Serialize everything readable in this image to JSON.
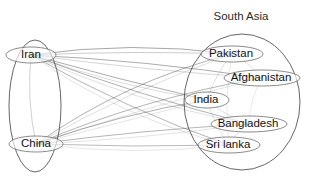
{
  "figure": {
    "kind": "network-graph",
    "background_color": "#ffffff",
    "width": 310,
    "height": 180
  },
  "clusters": [
    {
      "id": "left-cluster",
      "label": "",
      "label_visible": false,
      "shape": "ellipse",
      "cx": 35,
      "cy": 106,
      "rx": 26,
      "ry": 66,
      "stroke": "#4a4a4a"
    },
    {
      "id": "south-asia-cluster",
      "label": "South Asia",
      "label_visible": true,
      "label_x": 241,
      "label_y": 17,
      "shape": "ellipse",
      "cx": 242,
      "cy": 102,
      "rx": 58,
      "ry": 68,
      "stroke": "#4a4a4a"
    }
  ],
  "nodes": [
    {
      "id": "iran",
      "label": "Iran",
      "cluster": "left-cluster",
      "cx": 31,
      "cy": 55,
      "rx": 25,
      "ry": 8,
      "label_x": 31,
      "label_y": 55
    },
    {
      "id": "china",
      "label": "China",
      "cluster": "left-cluster",
      "cx": 36,
      "cy": 144,
      "rx": 27,
      "ry": 8,
      "label_x": 36,
      "label_y": 144
    },
    {
      "id": "pakistan",
      "label": "Pakistan",
      "cluster": "south-asia-cluster",
      "cx": 232,
      "cy": 54,
      "rx": 31,
      "ry": 8,
      "label_x": 231,
      "label_y": 54
    },
    {
      "id": "afghanistan",
      "label": "Afghanistan",
      "cluster": "south-asia-cluster",
      "cx": 262,
      "cy": 78,
      "rx": 38,
      "ry": 8,
      "label_x": 261,
      "label_y": 78
    },
    {
      "id": "india",
      "label": "India",
      "cluster": "south-asia-cluster",
      "cx": 207,
      "cy": 100,
      "rx": 22,
      "ry": 8,
      "label_x": 206,
      "label_y": 100
    },
    {
      "id": "bangladesh",
      "label": "Bangladesh",
      "cluster": "south-asia-cluster",
      "cx": 249,
      "cy": 124,
      "rx": 38,
      "ry": 8,
      "label_x": 248,
      "label_y": 124
    },
    {
      "id": "srilanka",
      "label": "Sri lanka",
      "cluster": "south-asia-cluster",
      "cx": 229,
      "cy": 145,
      "rx": 31,
      "ry": 8,
      "label_x": 228,
      "label_y": 145
    }
  ],
  "edges": [
    {
      "source": "iran",
      "target": "pakistan",
      "opacity": 0.95,
      "bow": -14
    },
    {
      "source": "iran",
      "target": "pakistan",
      "opacity": 0.55,
      "bow": -4
    },
    {
      "source": "iran",
      "target": "afghanistan",
      "opacity": 0.9,
      "bow": -6
    },
    {
      "source": "iran",
      "target": "afghanistan",
      "opacity": 0.45,
      "bow": 4
    },
    {
      "source": "iran",
      "target": "india",
      "opacity": 0.9,
      "bow": 2
    },
    {
      "source": "iran",
      "target": "india",
      "opacity": 0.4,
      "bow": 9
    },
    {
      "source": "iran",
      "target": "bangladesh",
      "opacity": 0.85,
      "bow": 6
    },
    {
      "source": "iran",
      "target": "bangladesh",
      "opacity": 0.35,
      "bow": 14
    },
    {
      "source": "iran",
      "target": "srilanka",
      "opacity": 0.8,
      "bow": 10
    },
    {
      "source": "iran",
      "target": "srilanka",
      "opacity": 0.3,
      "bow": 20
    },
    {
      "source": "china",
      "target": "pakistan",
      "opacity": 0.85,
      "bow": -20
    },
    {
      "source": "china",
      "target": "pakistan",
      "opacity": 0.35,
      "bow": -10
    },
    {
      "source": "china",
      "target": "afghanistan",
      "opacity": 0.8,
      "bow": -14
    },
    {
      "source": "china",
      "target": "afghanistan",
      "opacity": 0.3,
      "bow": -5
    },
    {
      "source": "china",
      "target": "india",
      "opacity": 0.85,
      "bow": -8
    },
    {
      "source": "china",
      "target": "india",
      "opacity": 0.3,
      "bow": 0
    },
    {
      "source": "china",
      "target": "bangladesh",
      "opacity": 0.8,
      "bow": -4
    },
    {
      "source": "china",
      "target": "bangladesh",
      "opacity": 0.3,
      "bow": 5
    },
    {
      "source": "china",
      "target": "srilanka",
      "opacity": 0.75,
      "bow": 3
    },
    {
      "source": "china",
      "target": "srilanka",
      "opacity": 0.28,
      "bow": 12
    },
    {
      "source": "iran",
      "target": "china",
      "opacity": 0.5,
      "bow": 7
    },
    {
      "source": "pakistan",
      "target": "india",
      "opacity": 0.35,
      "bow": 5
    },
    {
      "source": "pakistan",
      "target": "afghanistan",
      "opacity": 0.35,
      "bow": -4
    },
    {
      "source": "india",
      "target": "bangladesh",
      "opacity": 0.35,
      "bow": 5
    },
    {
      "source": "india",
      "target": "srilanka",
      "opacity": 0.3,
      "bow": 4
    },
    {
      "source": "bangladesh",
      "target": "srilanka",
      "opacity": 0.3,
      "bow": 4
    },
    {
      "source": "afghanistan",
      "target": "bangladesh",
      "opacity": 0.25,
      "bow": 6
    },
    {
      "source": "pakistan",
      "target": "srilanka",
      "opacity": 0.25,
      "bow": 7
    }
  ]
}
